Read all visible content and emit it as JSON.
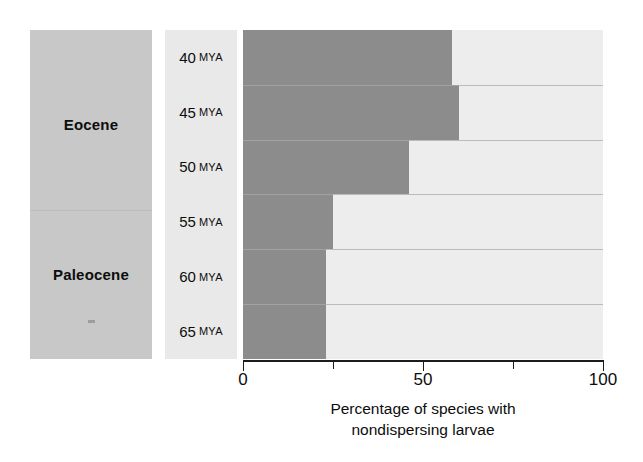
{
  "chart_data": {
    "type": "bar",
    "orientation": "horizontal",
    "title": "",
    "xlabel": "Percentage of species with nondispersing larvae",
    "ylabel": "",
    "categories": [
      "40 MYA",
      "45 MYA",
      "50 MYA",
      "55 MYA",
      "60 MYA",
      "65 MYA"
    ],
    "values": [
      58,
      60,
      46,
      25,
      23,
      23
    ],
    "xlim": [
      0,
      100
    ],
    "xticks": [
      0,
      25,
      50,
      75,
      100
    ],
    "xticklabels": [
      "0",
      "",
      "50",
      "",
      "100"
    ],
    "grid": true,
    "legend": null,
    "series": [
      {
        "name": "Percentage of species with nondispersing larvae",
        "values": [
          58,
          60,
          46,
          25,
          23,
          23
        ]
      }
    ],
    "group_annotations": [
      {
        "label": "Eocene",
        "categories": [
          "40 MYA",
          "45 MYA",
          "50 MYA"
        ]
      },
      {
        "label": "Paleocene",
        "categories": [
          "55 MYA",
          "60 MYA",
          "65 MYA"
        ]
      }
    ]
  },
  "epoch_panel": {
    "labels": [
      {
        "name": "Eocene"
      },
      {
        "name": "Paleocene"
      }
    ]
  },
  "mya_panel": {
    "rows": [
      {
        "value": "40",
        "unit": "MYA"
      },
      {
        "value": "45",
        "unit": "MYA"
      },
      {
        "value": "50",
        "unit": "MYA"
      },
      {
        "value": "55",
        "unit": "MYA"
      },
      {
        "value": "60",
        "unit": "MYA"
      },
      {
        "value": "65",
        "unit": "MYA"
      }
    ]
  },
  "axis": {
    "ticks": [
      {
        "label": "0",
        "value": 0
      },
      {
        "label": "",
        "value": 25
      },
      {
        "label": "50",
        "value": 50
      },
      {
        "label": "",
        "value": 75
      },
      {
        "label": "100",
        "value": 100
      }
    ],
    "caption_line1": "Percentage of species with",
    "caption_line2": "nondispersing larvae"
  },
  "colors": {
    "bar_fill": "#8c8c8c",
    "plot_background": "#ededed",
    "epoch_panel": "#c8c8c8",
    "mya_panel": "#e9e9e9",
    "axis": "#1c1c1c",
    "gridline": "#a9a9a9"
  }
}
